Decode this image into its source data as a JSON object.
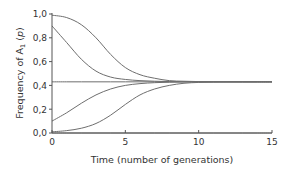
{
  "chart_data": {
    "type": "line",
    "title": "",
    "xlabel": "Time (number of generations)",
    "ylabel_main": "Frequency of A",
    "ylabel_sub": "1",
    "ylabel_var": "p",
    "xlim": [
      0,
      15
    ],
    "ylim": [
      0,
      1.0
    ],
    "xticks": [
      0,
      5,
      10,
      15
    ],
    "xtick_labels": [
      "0",
      "5",
      "10",
      "15"
    ],
    "yticks": [
      0,
      0.2,
      0.4,
      0.6,
      0.8,
      1.0
    ],
    "ytick_labels": [
      "0,0",
      "0,2",
      "0,4",
      "0,6",
      "0,8",
      "1,0"
    ],
    "grid": false,
    "legend": null,
    "equilibrium": 0.43,
    "x": [
      0,
      1,
      2,
      3,
      4,
      5,
      6,
      7,
      8,
      9,
      10,
      11,
      12,
      13,
      14,
      15
    ],
    "series": [
      {
        "name": "p0=0.99",
        "values": [
          0.99,
          0.97,
          0.91,
          0.8,
          0.66,
          0.55,
          0.49,
          0.46,
          0.44,
          0.435,
          0.432,
          0.431,
          0.43,
          0.43,
          0.43,
          0.43
        ]
      },
      {
        "name": "p0=0.9",
        "values": [
          0.9,
          0.76,
          0.62,
          0.52,
          0.47,
          0.45,
          0.44,
          0.435,
          0.432,
          0.431,
          0.43,
          0.43,
          0.43,
          0.43,
          0.43,
          0.43
        ]
      },
      {
        "name": "p0=0.43",
        "values": [
          0.43,
          0.43,
          0.43,
          0.43,
          0.43,
          0.43,
          0.43,
          0.43,
          0.43,
          0.43,
          0.43,
          0.43,
          0.43,
          0.43,
          0.43,
          0.43
        ]
      },
      {
        "name": "p0=0.1",
        "values": [
          0.1,
          0.17,
          0.25,
          0.32,
          0.37,
          0.4,
          0.415,
          0.423,
          0.427,
          0.429,
          0.43,
          0.43,
          0.43,
          0.43,
          0.43,
          0.43
        ]
      },
      {
        "name": "p0=0.01",
        "values": [
          0.01,
          0.02,
          0.04,
          0.08,
          0.15,
          0.24,
          0.32,
          0.37,
          0.4,
          0.418,
          0.425,
          0.428,
          0.43,
          0.43,
          0.43,
          0.43
        ]
      },
      {
        "name": "p0=0",
        "values": [
          0,
          0,
          0,
          0,
          0,
          0,
          0,
          0,
          0,
          0,
          0,
          0,
          0,
          0,
          0,
          0
        ]
      }
    ],
    "colors": {
      "curve": "#6e6e6e",
      "axis": "#555555",
      "text": "#333333"
    }
  }
}
